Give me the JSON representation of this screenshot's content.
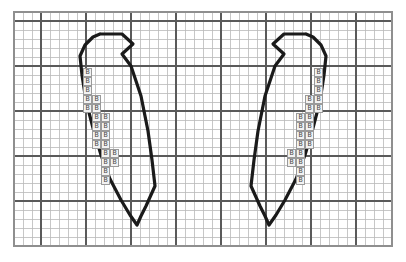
{
  "canvas": {
    "width": 406,
    "height": 262,
    "background": "#ffffff"
  },
  "grid": {
    "origin_x": 14,
    "origin_y": 12,
    "cell": 9,
    "cols": 42,
    "rows": 26,
    "minor_color": "#b9b9b9",
    "major_color": "#5a5a5a",
    "major_every": 5,
    "major_x_offset": 3,
    "major_y_offset": 1,
    "border_color": "#8f8f8f",
    "label": "graph-paper-grid"
  },
  "symbol": {
    "glyph": "B",
    "fill": "#f2f2f2",
    "stroke": "#9a9a9a",
    "text_color": "#4a4a4a",
    "name": "stitch-symbol-b"
  },
  "outline": {
    "color": "#1a1a1a",
    "width": 3.2,
    "name": "motif-outline"
  },
  "chart_data": {
    "type": "table",
    "xlabel": "",
    "ylabel": "",
    "grid": true,
    "legend": [
      {
        "symbol": "B",
        "label": "B stitch"
      }
    ],
    "motifs": [
      {
        "name": "left-leaf-motif",
        "outline_points": "100,34 122,34 133,44 122,54 131,66 141,96 148,131 152,160 155,186 146,206 141,216 137,225 130,215 121,200 110,179 101,155 93,128 86,101 82,75 80,56 85,45 93,37 100,34",
        "symbols": [
          {
            "col": 0,
            "row": 0,
            "glyph": "B"
          },
          {
            "col": 0,
            "row": 1,
            "glyph": "B"
          },
          {
            "col": 0,
            "row": 2,
            "glyph": "B"
          },
          {
            "col": 0,
            "row": 3,
            "glyph": "B"
          },
          {
            "col": 1,
            "row": 3,
            "glyph": "B"
          },
          {
            "col": 0,
            "row": 4,
            "glyph": "B"
          },
          {
            "col": 1,
            "row": 4,
            "glyph": "B"
          },
          {
            "col": 1,
            "row": 5,
            "glyph": "B"
          },
          {
            "col": 2,
            "row": 5,
            "glyph": "B"
          },
          {
            "col": 1,
            "row": 6,
            "glyph": "B"
          },
          {
            "col": 2,
            "row": 6,
            "glyph": "B"
          },
          {
            "col": 1,
            "row": 7,
            "glyph": "B"
          },
          {
            "col": 2,
            "row": 7,
            "glyph": "B"
          },
          {
            "col": 1,
            "row": 8,
            "glyph": "B"
          },
          {
            "col": 2,
            "row": 8,
            "glyph": "B"
          },
          {
            "col": 2,
            "row": 9,
            "glyph": "B"
          },
          {
            "col": 3,
            "row": 9,
            "glyph": "B"
          },
          {
            "col": 2,
            "row": 10,
            "glyph": "B"
          },
          {
            "col": 3,
            "row": 10,
            "glyph": "B"
          },
          {
            "col": 2,
            "row": 11,
            "glyph": "B"
          },
          {
            "col": 2,
            "row": 12,
            "glyph": "B"
          }
        ],
        "symbol_origin": {
          "x": 83,
          "y": 68
        }
      },
      {
        "name": "right-leaf-motif",
        "outline_points": "306,34 284,34 273,44 284,54 275,66 265,96 258,131 254,160 251,186 260,206 265,216 269,225 276,215 285,200 296,179 305,155 313,128 320,101 324,75 326,56 321,45 313,37 306,34",
        "symbols": [
          {
            "col": 0,
            "row": 0,
            "glyph": "B"
          },
          {
            "col": 0,
            "row": 1,
            "glyph": "B"
          },
          {
            "col": 0,
            "row": 2,
            "glyph": "B"
          },
          {
            "col": 0,
            "row": 3,
            "glyph": "B"
          },
          {
            "col": -1,
            "row": 3,
            "glyph": "B"
          },
          {
            "col": 0,
            "row": 4,
            "glyph": "B"
          },
          {
            "col": -1,
            "row": 4,
            "glyph": "B"
          },
          {
            "col": -1,
            "row": 5,
            "glyph": "B"
          },
          {
            "col": -2,
            "row": 5,
            "glyph": "B"
          },
          {
            "col": -1,
            "row": 6,
            "glyph": "B"
          },
          {
            "col": -2,
            "row": 6,
            "glyph": "B"
          },
          {
            "col": -1,
            "row": 7,
            "glyph": "B"
          },
          {
            "col": -2,
            "row": 7,
            "glyph": "B"
          },
          {
            "col": -1,
            "row": 8,
            "glyph": "B"
          },
          {
            "col": -2,
            "row": 8,
            "glyph": "B"
          },
          {
            "col": -2,
            "row": 9,
            "glyph": "B"
          },
          {
            "col": -3,
            "row": 9,
            "glyph": "B"
          },
          {
            "col": -2,
            "row": 10,
            "glyph": "B"
          },
          {
            "col": -3,
            "row": 10,
            "glyph": "B"
          },
          {
            "col": -2,
            "row": 11,
            "glyph": "B"
          },
          {
            "col": -2,
            "row": 12,
            "glyph": "B"
          }
        ],
        "symbol_origin": {
          "x": 314,
          "y": 68
        }
      }
    ]
  }
}
